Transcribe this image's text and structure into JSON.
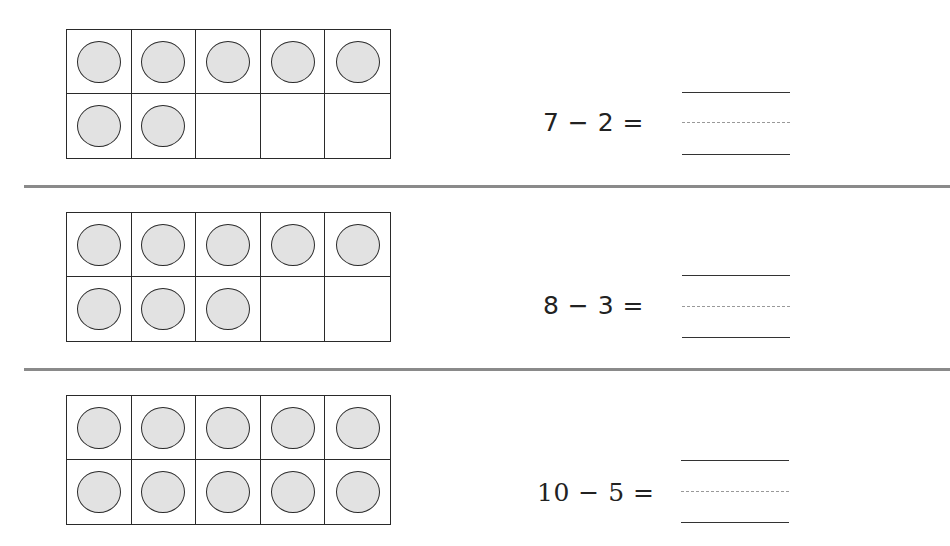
{
  "worksheet": {
    "problems": [
      {
        "equation": "7 − 2 =",
        "minuend": 7,
        "subtrahend": 2,
        "answer": "",
        "ten_frame": {
          "columns": 5,
          "rows": 2,
          "filled_counters": 7,
          "counter_color": "#e2e2e2"
        }
      },
      {
        "equation": "8 − 3 =",
        "minuend": 8,
        "subtrahend": 3,
        "answer": "",
        "ten_frame": {
          "columns": 5,
          "rows": 2,
          "filled_counters": 8,
          "counter_color": "#e2e2e2"
        }
      },
      {
        "equation": "10 − 5 =",
        "minuend": 10,
        "subtrahend": 5,
        "answer": "",
        "ten_frame": {
          "columns": 5,
          "rows": 2,
          "filled_counters": 10,
          "counter_color": "#e2e2e2"
        }
      }
    ],
    "separator_color": "#8a8a8a",
    "line_color": "#333333"
  }
}
